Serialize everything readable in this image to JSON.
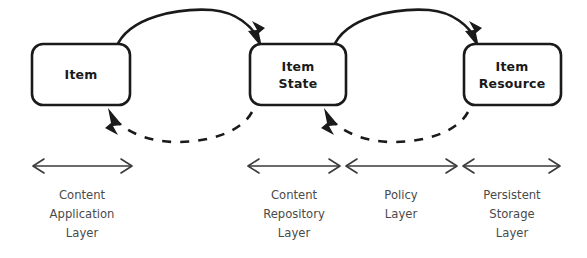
{
  "diagram": {
    "background_color": "#ffffff",
    "stroke_color": "#1a1a1a",
    "caption_color": "#4a4a4a",
    "nodes": [
      {
        "id": "item",
        "label_line1": "Item",
        "label_line2": ""
      },
      {
        "id": "item-state",
        "label_line1": "Item",
        "label_line2": "State"
      },
      {
        "id": "item-resource",
        "label_line1": "Item",
        "label_line2": "Resource"
      }
    ],
    "flows": [
      {
        "id": "item-to-item-state",
        "style": "solid",
        "direction": "forward"
      },
      {
        "id": "item-state-to-item-resource",
        "style": "solid",
        "direction": "forward"
      },
      {
        "id": "item-state-to-item",
        "style": "dashed",
        "direction": "backward"
      },
      {
        "id": "item-resource-to-item-state",
        "style": "dashed",
        "direction": "backward"
      }
    ],
    "layers": [
      {
        "id": "content-application-layer",
        "line1": "Content",
        "line2": "Application",
        "line3": "Layer"
      },
      {
        "id": "content-repository-layer",
        "line1": "Content",
        "line2": "Repository",
        "line3": "Layer"
      },
      {
        "id": "policy-layer",
        "line1": "Policy",
        "line2": "Layer",
        "line3": ""
      },
      {
        "id": "persistent-storage-layer",
        "line1": "Persistent",
        "line2": "Storage",
        "line3": "Layer"
      }
    ]
  }
}
